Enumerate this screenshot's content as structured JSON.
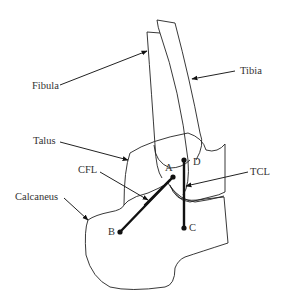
{
  "figure": {
    "labels": {
      "fibula": "Fibula",
      "tibia": "Tibia",
      "talus": "Talus",
      "cfl": "CFL",
      "tcl": "TCL",
      "calcaneus": "Calcaneus"
    },
    "points": {
      "a": "A",
      "b": "B",
      "c": "C",
      "d": "D"
    },
    "colors": {
      "line": "#222222",
      "text": "#333333",
      "background": "#ffffff"
    }
  }
}
